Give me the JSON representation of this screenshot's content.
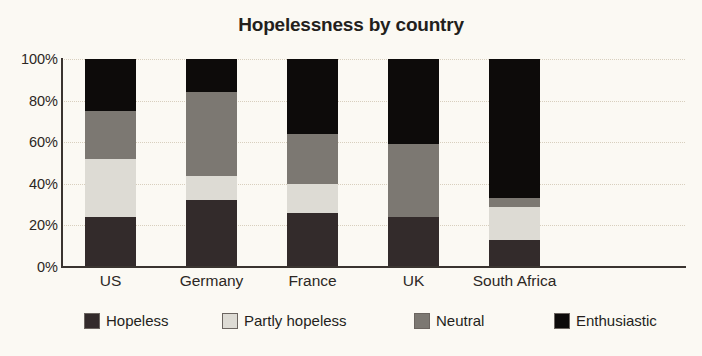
{
  "chart_data": {
    "type": "bar",
    "subtype": "stacked-bar-100-percent",
    "title": "Hopelessness by country",
    "xlabel": "",
    "ylabel": "",
    "ylim": [
      0,
      100
    ],
    "yticks": [
      "0%",
      "20%",
      "40%",
      "60%",
      "80%",
      "100%"
    ],
    "ytick_values": [
      0,
      20,
      40,
      60,
      80,
      100
    ],
    "grid": true,
    "legend_position": "bottom",
    "categories": [
      "US",
      "Germany",
      "France",
      "UK",
      "South Africa"
    ],
    "series": [
      {
        "name": "Hopeless",
        "color": "#332b2b",
        "values": [
          24,
          32,
          26,
          24,
          13
        ]
      },
      {
        "name": "Partly hopeless",
        "color": "#dddbd4",
        "values": [
          28,
          12,
          14,
          0,
          16
        ]
      },
      {
        "name": "Neutral",
        "color": "#7c7872",
        "values": [
          23,
          40,
          24,
          35,
          4
        ]
      },
      {
        "name": "Enthusiastic",
        "color": "#0d0b0a",
        "values": [
          25,
          16,
          36,
          41,
          67
        ]
      }
    ]
  },
  "legend": {
    "items": [
      {
        "label": "Hopeless",
        "color": "#332b2b"
      },
      {
        "label": "Partly hopeless",
        "color": "#dddbd4"
      },
      {
        "label": "Neutral",
        "color": "#7c7872"
      },
      {
        "label": "Enthusiastic",
        "color": "#0d0b0a"
      }
    ]
  },
  "colors": {
    "background": "#fbf9f3",
    "axis": "#3a3430",
    "gridline": "#d8cfbe",
    "text": "#2c2724"
  }
}
